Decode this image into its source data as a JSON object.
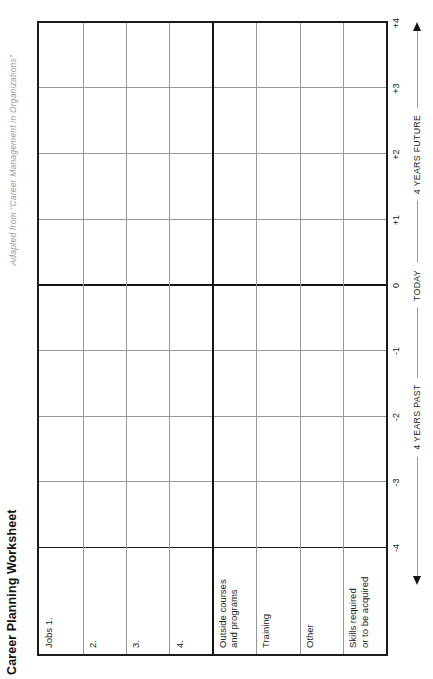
{
  "page": {
    "title": "Career Planning Worksheet",
    "attribution": "Adapted from “Career Management in Organizations”"
  },
  "table": {
    "row_labels": [
      "Jobs 1.",
      "2.",
      "3.",
      "4.",
      "Outside courses\nand programs",
      "Training",
      "Other",
      "Skills required\nor to be acquired"
    ]
  },
  "axis": {
    "ticks": [
      "-4",
      "-3",
      "-2",
      "-1",
      "0",
      "+1",
      "+2",
      "+3",
      "+4"
    ],
    "past_label": "4 YEARS PAST",
    "today_label": "TODAY",
    "future_label": "4 YEARS FUTURE"
  },
  "colors": {
    "border": "#1c1c1c",
    "gridline": "#97979c",
    "label_text": "#222222",
    "attribution_text": "#9a9aa0"
  }
}
